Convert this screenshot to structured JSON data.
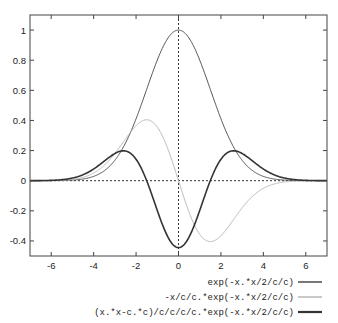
{
  "chart_data": {
    "type": "line",
    "title": "",
    "xlabel": "",
    "ylabel": "",
    "xlim": [
      -7,
      7
    ],
    "ylim": [
      -0.5,
      1.1
    ],
    "grid": false,
    "zero_axes": "dotted",
    "legend_position": "below-right",
    "x_ticks": [
      -6,
      -4,
      -2,
      0,
      2,
      4,
      6
    ],
    "x_tick_labels": [
      "-6",
      "-4",
      "-2",
      "0",
      "2",
      "4",
      "6"
    ],
    "y_ticks": [
      1,
      0.8,
      0.6,
      0.4,
      0.2,
      0,
      -0.2,
      -0.4
    ],
    "y_tick_labels": [
      "1",
      "0.8",
      "0.6",
      "0.4",
      "0.2",
      "0",
      "-0.2",
      "-0.4"
    ],
    "parameter_c": 1.5,
    "series": [
      {
        "name": "exp(-x.*x/2/c/c)",
        "color": "#555555",
        "width": 1,
        "formula": "gauss",
        "x": [
          -6,
          -4,
          -3,
          -2,
          -1.5,
          -1,
          0,
          1,
          1.5,
          2,
          3,
          4,
          6
        ],
        "values": [
          0.0003,
          0.028,
          0.135,
          0.411,
          0.607,
          0.801,
          1.0,
          0.801,
          0.607,
          0.411,
          0.135,
          0.028,
          0.0003
        ]
      },
      {
        "name": "-x/c/c.*exp(-x.*x/2/c/c)",
        "color": "#bbbbbb",
        "width": 1,
        "formula": "d1",
        "x": [
          -6,
          -4,
          -3,
          -2,
          -1.5,
          -1,
          0,
          1,
          1.5,
          2,
          3,
          4,
          6
        ],
        "values": [
          0.001,
          0.051,
          0.18,
          0.366,
          0.404,
          0.356,
          0,
          -0.356,
          -0.404,
          -0.366,
          -0.18,
          -0.051,
          -0.001
        ]
      },
      {
        "name": "(x.*x-c.*c)/c/c/c/c.*exp(-x.*x/2/c/c)",
        "color": "#333333",
        "width": 1.6,
        "formula": "d2",
        "x": [
          -6,
          -4,
          -3,
          -2.6,
          -2,
          -1.5,
          -1,
          0,
          1,
          1.5,
          2,
          2.6,
          3,
          4,
          6
        ],
        "values": [
          0.002,
          0.075,
          0.18,
          0.201,
          0.142,
          0,
          -0.198,
          -0.444,
          -0.198,
          0,
          0.142,
          0.201,
          0.18,
          0.075,
          0.002
        ]
      }
    ]
  },
  "legend": {
    "items": [
      {
        "label": "exp(-x.*x/2/c/c)",
        "color": "#555555"
      },
      {
        "label": "-x/c/c.*exp(-x.*x/2/c/c)",
        "color": "#bbbbbb"
      },
      {
        "label": "(x.*x-c.*c)/c/c/c/c.*exp(-x.*x/2/c/c)",
        "color": "#333333"
      }
    ]
  }
}
